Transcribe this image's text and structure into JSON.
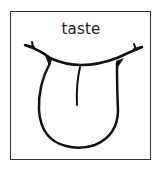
{
  "card": {
    "label": "taste",
    "illustration": "tongue-icon",
    "border_color": "#333333",
    "stroke_color": "#111111"
  }
}
